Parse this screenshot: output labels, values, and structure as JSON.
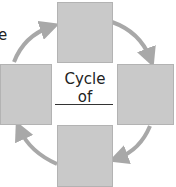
{
  "diagram": {
    "type": "cycle",
    "direction": "clockwise",
    "partial_text": "e",
    "center_label": "Cycle of",
    "center_blank": "________",
    "boxes": [
      {
        "position": "top",
        "label": ""
      },
      {
        "position": "right",
        "label": ""
      },
      {
        "position": "bottom",
        "label": ""
      },
      {
        "position": "left",
        "label": ""
      }
    ],
    "colors": {
      "box_fill": "#c9c9c9",
      "box_border": "#b3b3b3",
      "arrow": "#a8a8a8",
      "text": "#222222"
    }
  }
}
